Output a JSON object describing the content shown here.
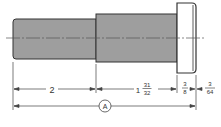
{
  "drawing": {
    "type": "stepped shaft / pin engineering drawing",
    "colors": {
      "body_fill": "#9e9e9e",
      "head_fill": "#ffffff",
      "outline": "#333333",
      "dimension_line": "#444444",
      "background": "#ffffff"
    },
    "dimensions": [
      {
        "label_whole": "2",
        "segment": "small-diameter shaft length"
      },
      {
        "label_whole": "1",
        "label_num": "31",
        "label_den": "32",
        "segment": "large-diameter shaft length"
      },
      {
        "label_num": "3",
        "label_den": "8",
        "segment": "head thickness"
      },
      {
        "label_num": "3",
        "label_den": "64",
        "segment": "head chamfer/offset"
      }
    ],
    "overall_dimension": {
      "label": "A"
    }
  }
}
